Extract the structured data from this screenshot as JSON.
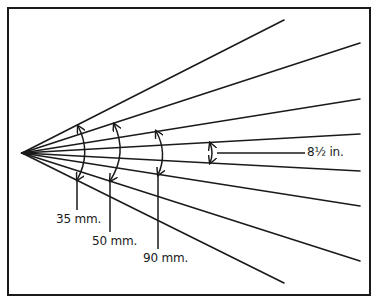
{
  "diagram": {
    "type": "lens angle-of-view comparison",
    "apex": [
      22,
      153
    ],
    "frame": {
      "x": 8,
      "y": 8,
      "width": 362,
      "height": 287
    },
    "rays": [
      {
        "end": [
          284,
          20
        ]
      },
      {
        "end": [
          360,
          43
        ]
      },
      {
        "end": [
          360,
          99
        ]
      },
      {
        "end": [
          360,
          134
        ]
      },
      {
        "end": [
          360,
          171
        ]
      },
      {
        "end": [
          360,
          206
        ]
      },
      {
        "end": [
          360,
          261
        ]
      },
      {
        "end": [
          284,
          283
        ]
      }
    ],
    "labels": [
      {
        "id": "35mm",
        "text": "35 mm."
      },
      {
        "id": "50mm",
        "text": "50 mm."
      },
      {
        "id": "90mm",
        "text": "90 mm."
      },
      {
        "id": "85in",
        "text": "8½ in."
      }
    ],
    "colors": {
      "ink": "#1a1a1a",
      "background": "#ffffff"
    }
  }
}
